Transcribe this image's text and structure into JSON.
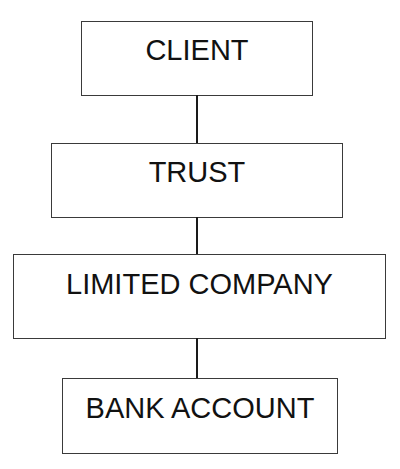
{
  "diagram": {
    "type": "vertical-hierarchy",
    "nodes": [
      {
        "id": "client",
        "label": "CLIENT"
      },
      {
        "id": "trust",
        "label": "TRUST"
      },
      {
        "id": "company",
        "label": "LIMITED COMPANY"
      },
      {
        "id": "bank",
        "label": "BANK ACCOUNT"
      }
    ],
    "edges": [
      {
        "from": "client",
        "to": "trust"
      },
      {
        "from": "trust",
        "to": "company"
      },
      {
        "from": "company",
        "to": "bank"
      }
    ],
    "colors": {
      "border": "#3a3a3a",
      "connector": "#1a1a1a",
      "text": "#111111",
      "background": "#ffffff"
    }
  }
}
